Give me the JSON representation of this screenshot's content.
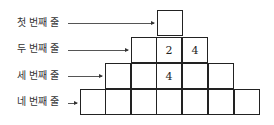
{
  "rows": [
    {
      "label": "첫 번째 줄",
      "cells": [
        "",
        "",
        "",
        "",
        "",
        "",
        ""
      ]
    },
    {
      "label": "두 번째 줄",
      "cells": [
        "",
        "2",
        "4"
      ]
    },
    {
      "label": "세 번째 줄",
      "cells": [
        "",
        "",
        "4",
        "",
        ""
      ]
    },
    {
      "label": "네 번째 줄",
      "cells": [
        "",
        "",
        "",
        "",
        "",
        "",
        ""
      ]
    }
  ],
  "labels": [
    "첫 번째 줄",
    "두 번째 줄",
    "세 번째 줄",
    "네 번째 줄"
  ],
  "grid": {
    "row1": [
      ""
    ],
    "row2": [
      "",
      "2",
      "4"
    ],
    "row3": [
      "",
      "",
      "4",
      "",
      ""
    ],
    "row4": [
      "",
      "",
      "",
      "",
      "",
      "",
      ""
    ]
  }
}
